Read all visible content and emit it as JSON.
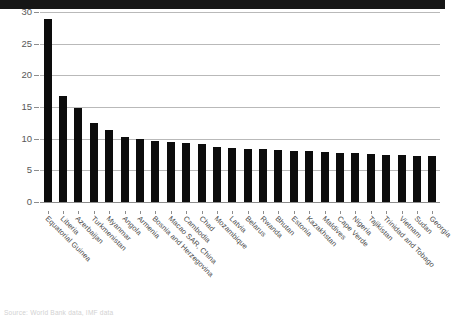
{
  "chart_data": {
    "type": "bar",
    "title": "",
    "subtitle": "",
    "xlabel": "",
    "ylabel": "",
    "ylim": [
      0,
      30
    ],
    "yticks": [
      0,
      5,
      10,
      15,
      20,
      25,
      30
    ],
    "grid": true,
    "legend": "none",
    "orientation": "vertical",
    "bar_color": "#0c0c0c",
    "categories": [
      "Equatorial Guinea",
      "Liberia",
      "Azerbaijan",
      "Turkmenistan",
      "Myanmar",
      "Angola",
      "Armenia",
      "Bosnia and Herzegovina",
      "Macao SAR, China",
      "Cambodia",
      "Chad",
      "Mozambique",
      "Latvia",
      "Belarus",
      "Rwanda",
      "Bhutan",
      "Estonia",
      "Kazakhstan",
      "Maldives",
      "Cape Verde",
      "Nigeria",
      "Tajikistan",
      "Trinidad and Tobago",
      "Vietnam",
      "Sudan",
      "Georgia"
    ],
    "values": [
      28.9,
      16.8,
      14.8,
      12.5,
      11.4,
      10.2,
      9.9,
      9.6,
      9.4,
      9.3,
      9.2,
      8.7,
      8.5,
      8.4,
      8.3,
      8.2,
      8.1,
      8.0,
      7.9,
      7.8,
      7.7,
      7.6,
      7.5,
      7.4,
      7.3,
      7.3
    ]
  },
  "axis": {
    "y_tick_labels": [
      "30",
      "25",
      "20",
      "15",
      "10",
      "5",
      "0"
    ]
  },
  "footer": {
    "source": "Source: World Bank data, IMF data"
  },
  "colors": {
    "bar": "#0c0c0c",
    "grid": "#b9b9b9",
    "axis_text": "#575757",
    "top_bar": "#161616"
  }
}
